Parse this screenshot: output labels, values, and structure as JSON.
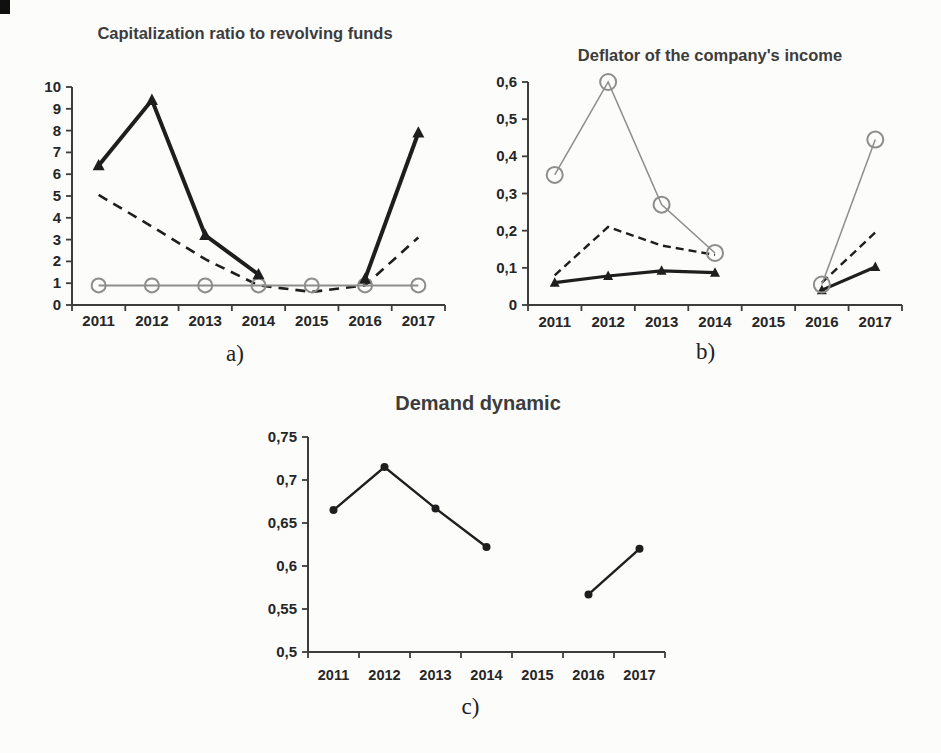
{
  "page": {
    "background_color": "#fcfcfb",
    "axis_color": "#3c3c3c",
    "tick_label_color": "#262626",
    "title_color": "#3c3c3c",
    "caption_color": "#222222"
  },
  "chart_data": [
    {
      "id": "a",
      "type": "line",
      "title": "Capitalization ratio to revolving funds",
      "caption": "a)",
      "xlabel": "",
      "ylabel": "",
      "grid": false,
      "legend": "none",
      "categories": [
        "2011",
        "2012",
        "2013",
        "2014",
        "2015",
        "2016",
        "2017"
      ],
      "ylim": [
        0,
        10
      ],
      "ytick_values": [
        0,
        1,
        2,
        3,
        4,
        5,
        6,
        7,
        8,
        9,
        10
      ],
      "ytick_labels": [
        "0",
        "1",
        "2",
        "3",
        "4",
        "5",
        "6",
        "7",
        "8",
        "9",
        "10"
      ],
      "series": [
        {
          "name": "dashed-black-line",
          "marker": "none",
          "marker_size": 0,
          "dash": "10,7",
          "width": 2.6,
          "color": "#1e1e1e",
          "values": [
            5.05,
            3.6,
            2.1,
            0.9,
            0.6,
            0.9,
            3.1
          ]
        },
        {
          "name": "gray-open-circle-line",
          "marker": "circle-open",
          "marker_size": 7,
          "dash": null,
          "width": 2,
          "color": "#8d8d8d",
          "values": [
            0.9,
            0.9,
            0.9,
            0.9,
            0.9,
            0.9,
            0.9
          ]
        },
        {
          "name": "solid-thick-triangle-line",
          "marker": "triangle",
          "marker_size": 6,
          "dash": null,
          "width": 4,
          "color": "#1e1e1e",
          "values": [
            6.4,
            9.4,
            3.2,
            1.4,
            null,
            1.2,
            7.9
          ]
        }
      ]
    },
    {
      "id": "b",
      "type": "line",
      "title": "Deflator of the company's income",
      "caption": "b)",
      "xlabel": "",
      "ylabel": "",
      "grid": false,
      "legend": "none",
      "categories": [
        "2011",
        "2012",
        "2013",
        "2014",
        "2015",
        "2016",
        "2017"
      ],
      "ylim": [
        0,
        0.6
      ],
      "ytick_values": [
        0,
        0.1,
        0.2,
        0.3,
        0.4,
        0.5,
        0.6
      ],
      "ytick_labels": [
        "0",
        "0,1",
        "0,2",
        "0,3",
        "0,4",
        "0,5",
        "0,6"
      ],
      "series": [
        {
          "name": "dashed-black-line",
          "marker": "none",
          "marker_size": 0,
          "dash": "8,5",
          "width": 2.4,
          "color": "#1e1e1e",
          "values": [
            0.08,
            0.21,
            0.16,
            0.135,
            null,
            0.06,
            0.195
          ]
        },
        {
          "name": "solid-thick-triangle-line",
          "marker": "triangle",
          "marker_size": 5,
          "dash": null,
          "width": 3.2,
          "color": "#1e1e1e",
          "values": [
            0.06,
            0.078,
            0.092,
            0.087,
            null,
            0.04,
            0.102
          ]
        },
        {
          "name": "gray-open-circle-line",
          "marker": "circle-open",
          "marker_size": 8,
          "dash": null,
          "width": 1.5,
          "color": "#8d8d8d",
          "values": [
            0.35,
            0.6,
            0.27,
            0.14,
            null,
            0.055,
            0.445
          ]
        }
      ]
    },
    {
      "id": "c",
      "type": "line",
      "title": "Demand dynamic",
      "caption": "c)",
      "xlabel": "",
      "ylabel": "",
      "grid": false,
      "legend": "none",
      "categories": [
        "2011",
        "2012",
        "2013",
        "2014",
        "2015",
        "2016",
        "2017"
      ],
      "ylim": [
        0.5,
        0.75
      ],
      "ytick_values": [
        0.5,
        0.55,
        0.6,
        0.65,
        0.7,
        0.75
      ],
      "ytick_labels": [
        "0,5",
        "0,55",
        "0,6",
        "0,65",
        "0,7",
        "0,75"
      ],
      "series": [
        {
          "name": "solid-dot-line",
          "marker": "dot",
          "marker_size": 4,
          "dash": null,
          "width": 2.4,
          "color": "#1e1e1e",
          "values": [
            0.665,
            0.715,
            0.667,
            0.622,
            null,
            0.567,
            0.62
          ]
        }
      ]
    }
  ]
}
